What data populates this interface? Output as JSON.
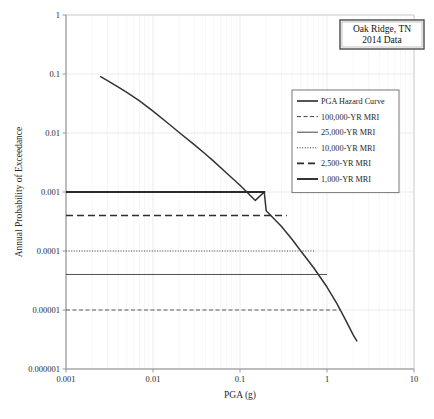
{
  "chart_data": {
    "type": "line",
    "title": "",
    "xlabel": "PGA (g)",
    "ylabel": "Annual Probability of Exceedance",
    "xscale": "log",
    "yscale": "log",
    "xlim": [
      0.001,
      10
    ],
    "ylim": [
      1e-06,
      1
    ],
    "grid": true,
    "legend_position": "right-upper-inside",
    "xticks": [
      "0.001",
      "0.01",
      "0.1",
      "1",
      "10"
    ],
    "xtick_values": [
      0.001,
      0.01,
      0.1,
      1,
      10
    ],
    "yticks": [
      "1",
      "0.1",
      "0.01",
      "0.001",
      "0.0001",
      "0.00001",
      "0.000001"
    ],
    "ytick_values": [
      1,
      0.1,
      0.01,
      0.001,
      0.0001,
      1e-05,
      1e-06
    ],
    "annotation": {
      "line1": "Oak Ridge, TN",
      "line2": "2014 Data"
    },
    "series": [
      {
        "name": "PGA Hazard Curve",
        "style": "solid",
        "width": 1.5,
        "color": "#333333",
        "points": [
          [
            0.0025,
            0.09
          ],
          [
            0.003,
            0.077
          ],
          [
            0.004,
            0.06
          ],
          [
            0.005,
            0.049
          ],
          [
            0.007,
            0.035
          ],
          [
            0.01,
            0.0235
          ],
          [
            0.015,
            0.0145
          ],
          [
            0.02,
            0.0102
          ],
          [
            0.03,
            0.0063
          ],
          [
            0.04,
            0.0044
          ],
          [
            0.05,
            0.0033
          ],
          [
            0.07,
            0.0021
          ],
          [
            0.1,
            0.0013
          ],
          [
            0.15,
            0.00072
          ],
          [
            0.19,
            0.001
          ],
          [
            0.2,
            0.00048
          ],
          [
            0.3,
            0.00026
          ],
          [
            0.4,
            0.000155
          ],
          [
            0.5,
            0.0001
          ],
          [
            0.7,
            5.25e-05
          ],
          [
            1.0,
            2.45e-05
          ],
          [
            1.3,
            1.28e-05
          ],
          [
            1.6,
            7.2e-06
          ],
          [
            2.0,
            3.8e-06
          ],
          [
            2.2,
            3e-06
          ]
        ]
      },
      {
        "name": "100,000-YR MRI",
        "style": "dashed-short",
        "width": 0.9,
        "color": "#4a4a4a",
        "level": 1e-05,
        "x_start": 0.001,
        "x_end": 1.45
      },
      {
        "name": "25,000-YR MRI",
        "style": "solid",
        "width": 0.9,
        "color": "#3c3c3c",
        "level": 4e-05,
        "x_start": 0.001,
        "x_end": 1.0
      },
      {
        "name": "10,000-YR MRI",
        "style": "dotted",
        "width": 1.0,
        "color": "#4a4a4a",
        "level": 0.0001,
        "x_start": 0.001,
        "x_end": 0.72
      },
      {
        "name": "2,500-YR MRI",
        "style": "dashed-long",
        "width": 1.6,
        "color": "#2e2e2e",
        "level": 0.0004,
        "x_start": 0.001,
        "x_end": 0.345
      },
      {
        "name": "1,000-YR MRI",
        "style": "solid",
        "width": 1.9,
        "color": "#2b2b2b",
        "level": 0.001,
        "x_start": 0.001,
        "x_end": 0.195
      }
    ],
    "legend_entries": [
      {
        "label": "PGA Hazard Curve",
        "style": "solid",
        "width": 1.6
      },
      {
        "label": "100,000-YR MRI",
        "style": "dashed-short",
        "width": 0.9
      },
      {
        "label": "25,000-YR MRI",
        "style": "solid",
        "width": 0.9
      },
      {
        "label": "10,000-YR MRI",
        "style": "dotted",
        "width": 1.0
      },
      {
        "label": "2,500-YR MRI",
        "style": "dashed-long",
        "width": 1.6
      },
      {
        "label": "1,000-YR MRI",
        "style": "solid",
        "width": 1.9
      }
    ]
  }
}
